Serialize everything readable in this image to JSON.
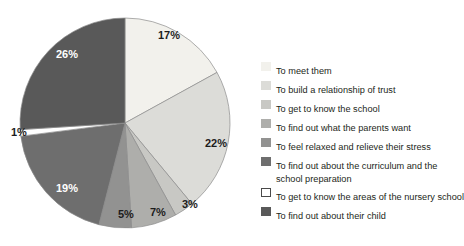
{
  "chart_data": {
    "type": "pie",
    "title": "",
    "subtitle": "",
    "xlabel": "",
    "ylabel": "",
    "grid": false,
    "legend_position": "right",
    "start_angle_deg": 0,
    "direction": "clockwise",
    "categories": [
      "To meet them",
      "To build a relationship of trust",
      "To get to know the school",
      "To find out what the parents want",
      "To feel relaxed and relieve their stress",
      "To find out about the curriculum and the school preparation",
      "To get to know the areas of the nursery school",
      "To find out about their child"
    ],
    "values": [
      17,
      22,
      3,
      7,
      5,
      19,
      1,
      26
    ],
    "value_labels": [
      "17%",
      "22%",
      "3%",
      "7%",
      "5%",
      "19%",
      "1%",
      "26%"
    ],
    "colors": [
      "#f2f1ec",
      "#dcdcd8",
      "#c8c8c4",
      "#aeaeab",
      "#929291",
      "#6e6e6e",
      "#ffffff",
      "#595959"
    ],
    "label_text_colors": [
      "dark",
      "dark",
      "dark",
      "dark",
      "dark",
      "light",
      "dark",
      "light"
    ]
  },
  "legend": {
    "items": [
      {
        "label": "To meet them",
        "label_line2": "",
        "swatch": "#f2f1ec",
        "outlined": false
      },
      {
        "label": "To build a relationship of trust",
        "label_line2": "",
        "swatch": "#dcdcd8",
        "outlined": false
      },
      {
        "label": "To get to know the school",
        "label_line2": "",
        "swatch": "#c8c8c4",
        "outlined": false
      },
      {
        "label": "To find out what the parents want",
        "label_line2": "",
        "swatch": "#aeaeab",
        "outlined": false
      },
      {
        "label": "To feel relaxed and relieve their stress",
        "label_line2": "",
        "swatch": "#929291",
        "outlined": false
      },
      {
        "label": "To find out about the curriculum and the",
        "label_line2": "school preparation",
        "swatch": "#6e6e6e",
        "outlined": false
      },
      {
        "label": "To get to know the areas of the nursery school",
        "label_line2": "",
        "swatch": "#ffffff",
        "outlined": true
      },
      {
        "label": "To find out about their child",
        "label_line2": "",
        "swatch": "#595959",
        "outlined": false
      }
    ]
  },
  "slice_labels": [
    {
      "text": "17%",
      "x": 158,
      "y": 30,
      "tone": "dark"
    },
    {
      "text": "22%",
      "x": 205,
      "y": 138,
      "tone": "dark"
    },
    {
      "text": "3%",
      "x": 182,
      "y": 199,
      "tone": "dark"
    },
    {
      "text": "7%",
      "x": 150,
      "y": 207,
      "tone": "dark"
    },
    {
      "text": "5%",
      "x": 118,
      "y": 209,
      "tone": "dark"
    },
    {
      "text": "19%",
      "x": 56,
      "y": 183,
      "tone": "light"
    },
    {
      "text": "1%",
      "x": 11,
      "y": 127,
      "tone": "dark"
    },
    {
      "text": "26%",
      "x": 56,
      "y": 49,
      "tone": "light"
    }
  ]
}
